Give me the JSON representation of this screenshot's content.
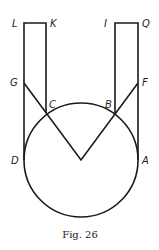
{
  "figure": {
    "caption": "Fig. 26",
    "points": {
      "L": {
        "label": "L",
        "x": 24,
        "y": 23
      },
      "K": {
        "label": "K",
        "x": 46,
        "y": 23
      },
      "I": {
        "label": "I",
        "x": 115,
        "y": 23
      },
      "Q": {
        "label": "Q",
        "x": 138,
        "y": 23
      },
      "G": {
        "label": "G",
        "x": 24,
        "y": 83
      },
      "F": {
        "label": "F",
        "x": 138,
        "y": 83
      },
      "C": {
        "label": "C",
        "x": 46,
        "y": 113
      },
      "B": {
        "label": "B",
        "x": 115,
        "y": 113
      },
      "D": {
        "label": "D",
        "x": 24,
        "y": 160
      },
      "A": {
        "label": "A",
        "x": 138,
        "y": 160
      }
    },
    "circle": {
      "cx": 81,
      "cy": 160,
      "r": 57
    },
    "vertex": {
      "x": 81,
      "y": 160
    },
    "stroke_color": "#1a1a1a"
  }
}
